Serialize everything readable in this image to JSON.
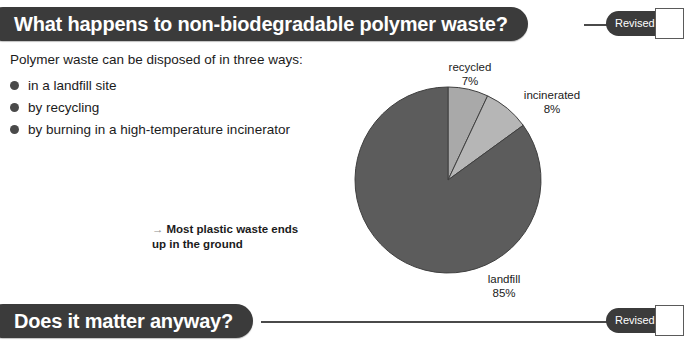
{
  "headers": [
    {
      "title": "What happens to non-biodegradable polymer waste?",
      "revised_label": "Revised"
    },
    {
      "title": "Does it matter anyway?",
      "revised_label": "Revised"
    }
  ],
  "body": {
    "intro": "Polymer waste can be disposed of in three ways:",
    "bullets": [
      "in a landfill site",
      "by recycling",
      "by burning in a high-temperature incinerator"
    ]
  },
  "annotation": {
    "arrow": "→",
    "line1": "Most plastic waste ends",
    "line2": "up in the ground"
  },
  "chart_data": {
    "type": "pie",
    "title": "",
    "categories": [
      "recycled",
      "incinerated",
      "landfill"
    ],
    "values": [
      7,
      8,
      85
    ],
    "unit": "%",
    "start_angle_deg": 0,
    "direction": "clockwise",
    "colors": [
      "#a9a9a9",
      "#b6b6b6",
      "#5c5c5c"
    ],
    "labels": [
      {
        "name": "recycled",
        "percent": "7%"
      },
      {
        "name": "incinerated",
        "percent": "8%"
      },
      {
        "name": "landfill",
        "percent": "85%"
      }
    ]
  },
  "colors": {
    "pill": "#3b3b3b",
    "connector": "#4a4a4a",
    "bullet": "#4a4a4a",
    "text": "#1b1b1b",
    "arrow": "#8d8d8d"
  }
}
